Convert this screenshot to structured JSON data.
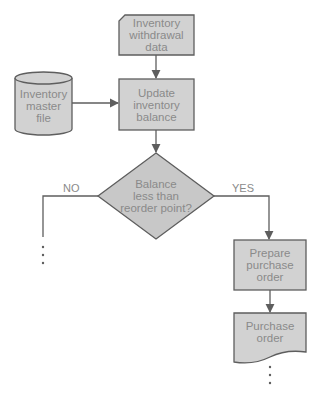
{
  "diagram": {
    "type": "flowchart",
    "colors": {
      "fill": "#d0d0d0",
      "stroke": "#6a6a6a",
      "text": "#8a8a8a",
      "line": "#6a6a6a"
    },
    "nodes": [
      {
        "id": "withdrawal_data",
        "shape": "card",
        "label": "Inventory\nwithdrawal\ndata"
      },
      {
        "id": "master_file",
        "shape": "cylinder",
        "label": "Inventory\nmaster\nfile"
      },
      {
        "id": "update_balance",
        "shape": "process",
        "label": "Update\ninventory\nbalance"
      },
      {
        "id": "decision",
        "shape": "diamond",
        "label": "Balance\nless than\nreorder point?"
      },
      {
        "id": "prepare_po",
        "shape": "process",
        "label": "Prepare\npurchase\norder"
      },
      {
        "id": "purchase_order",
        "shape": "document",
        "label": "Purchase\norder"
      }
    ],
    "edges": [
      {
        "from": "withdrawal_data",
        "to": "update_balance",
        "label": ""
      },
      {
        "from": "master_file",
        "to": "update_balance",
        "label": ""
      },
      {
        "from": "update_balance",
        "to": "decision",
        "label": ""
      },
      {
        "from": "decision",
        "to": "continuation_no",
        "label": "NO"
      },
      {
        "from": "decision",
        "to": "prepare_po",
        "label": "YES"
      },
      {
        "from": "prepare_po",
        "to": "purchase_order",
        "label": ""
      },
      {
        "from": "purchase_order",
        "to": "continuation_yes",
        "label": ""
      }
    ],
    "edge_labels": {
      "no": "NO",
      "yes": "YES"
    }
  }
}
